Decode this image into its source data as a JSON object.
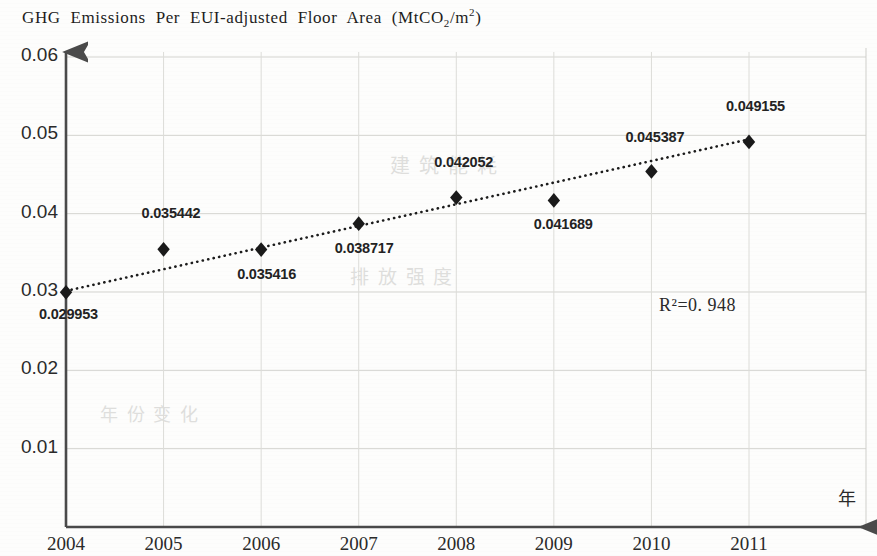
{
  "chart_data": {
    "type": "scatter",
    "title": "GHG Emissions Per EUI-adjusted Floor Area (MtCO2/m2)",
    "title_parts": {
      "main": "GHG  Emissions  Per  EUI-adjusted  Floor  Area  (MtCO",
      "sub": "2",
      "mid": "/m",
      "sup": "2",
      "end": ")"
    },
    "xlabel": "年",
    "ylabel": "",
    "categories": [
      "2004",
      "2005",
      "2006",
      "2007",
      "2008",
      "2009",
      "2010",
      "2011"
    ],
    "x": [
      2004,
      2005,
      2006,
      2007,
      2008,
      2009,
      2010,
      2011
    ],
    "values": [
      0.029953,
      0.035442,
      0.035416,
      0.038717,
      0.042052,
      0.041689,
      0.045387,
      0.049155
    ],
    "point_labels": [
      "0.029953",
      "0.035442",
      "0.035416",
      "0.038717",
      "0.042052",
      "0.041689",
      "0.045387",
      "0.049155"
    ],
    "ylim": [
      0,
      0.06
    ],
    "xlim": [
      2004,
      2011
    ],
    "yticks": [
      0.01,
      0.02,
      0.03,
      0.04,
      0.05,
      0.06
    ],
    "ytick_labels": [
      "0.01",
      "0.02",
      "0.03",
      "0.04",
      "0.05",
      "0.06"
    ],
    "xtick_labels": [
      "2004",
      "2005",
      "2006",
      "2007",
      "2008",
      "2009",
      "2010",
      "2011"
    ],
    "grid": true,
    "legend": "none",
    "annotations": [
      {
        "text": "R2=0. 948",
        "display": "R²=0. 948",
        "value": 0.948
      }
    ],
    "trendline": {
      "type": "linear-dotted",
      "start": {
        "x": 2004,
        "y": 0.030142
      },
      "end": {
        "x": 2011,
        "y": 0.049496
      }
    },
    "marker": {
      "shape": "diamond",
      "color": "#1a1a1a"
    },
    "series_name": "GHG Emissions Per EUI-adjusted Floor Area"
  },
  "ghost_text": {
    "a": "建 筑 能 耗",
    "b": "排 放 强 度",
    "c": "年 份 变 化"
  }
}
